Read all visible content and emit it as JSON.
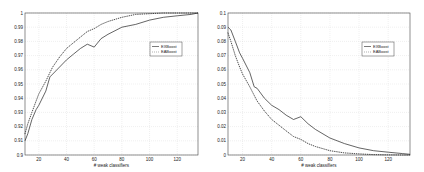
{
  "chart_data": [
    {
      "type": "line",
      "title": "",
      "xlabel": "# weak classifiers",
      "ylabel": "",
      "xlim": [
        10,
        135
      ],
      "ylim": [
        0.9,
        1.0
      ],
      "xticks": [
        20,
        40,
        60,
        80,
        100,
        120
      ],
      "yticks": [
        0.9,
        0.91,
        0.92,
        0.93,
        0.94,
        0.95,
        0.96,
        0.97,
        0.98,
        0.99,
        1
      ],
      "ytick_labels": [
        "0.9",
        "0.91",
        "0.92",
        "0.93",
        "0.94",
        "0.95",
        "0.96",
        "0.97",
        "0.98",
        "0.99",
        "1"
      ],
      "grid": true,
      "legend_position": "right-middle",
      "x": [
        10,
        12,
        15,
        18,
        20,
        25,
        28,
        30,
        35,
        40,
        45,
        50,
        55,
        60,
        65,
        70,
        80,
        90,
        100,
        110,
        120,
        130,
        135
      ],
      "series": [
        {
          "name": "EXBoost",
          "style": "solid",
          "values": [
            0.91,
            0.915,
            0.925,
            0.932,
            0.935,
            0.945,
            0.955,
            0.957,
            0.962,
            0.967,
            0.971,
            0.975,
            0.978,
            0.976,
            0.982,
            0.985,
            0.99,
            0.992,
            0.995,
            0.997,
            0.998,
            0.999,
            1.0
          ]
        },
        {
          "name": "EABoost",
          "style": "dotted",
          "values": [
            0.915,
            0.922,
            0.93,
            0.938,
            0.943,
            0.952,
            0.958,
            0.962,
            0.969,
            0.975,
            0.979,
            0.983,
            0.987,
            0.989,
            0.992,
            0.994,
            0.997,
            0.999,
            0.9995,
            1.0,
            1.0,
            1.0,
            1.0
          ]
        }
      ]
    },
    {
      "type": "line",
      "title": "",
      "xlabel": "# weak classifiers",
      "ylabel": "",
      "xlim": [
        10,
        135
      ],
      "ylim": [
        0,
        0.1
      ],
      "xticks": [
        20,
        40,
        60,
        80,
        100,
        120
      ],
      "yticks": [
        0,
        0.01,
        0.02,
        0.03,
        0.04,
        0.05,
        0.06,
        0.07,
        0.08,
        0.09,
        0.1
      ],
      "ytick_labels": [
        "0",
        "0.01",
        "0.02",
        "0.03",
        "0.04",
        "0.05",
        "0.06",
        "0.07",
        "0.08",
        "0.09",
        "0.1"
      ],
      "grid": true,
      "legend_position": "right-middle",
      "x": [
        10,
        12,
        15,
        18,
        20,
        25,
        28,
        30,
        35,
        40,
        45,
        50,
        55,
        60,
        65,
        70,
        80,
        90,
        100,
        110,
        120,
        130,
        135
      ],
      "series": [
        {
          "name": "EXBoost",
          "style": "solid",
          "values": [
            0.09,
            0.088,
            0.08,
            0.072,
            0.068,
            0.058,
            0.048,
            0.047,
            0.04,
            0.035,
            0.032,
            0.028,
            0.025,
            0.027,
            0.022,
            0.018,
            0.012,
            0.008,
            0.005,
            0.003,
            0.002,
            0.001,
            0.0005
          ]
        },
        {
          "name": "EABoost",
          "style": "dotted",
          "values": [
            0.086,
            0.08,
            0.07,
            0.062,
            0.057,
            0.048,
            0.042,
            0.038,
            0.031,
            0.025,
            0.021,
            0.017,
            0.013,
            0.011,
            0.008,
            0.006,
            0.003,
            0.0015,
            0.0008,
            0.0003,
            0.0001,
            0.0,
            0.0
          ]
        }
      ]
    }
  ]
}
